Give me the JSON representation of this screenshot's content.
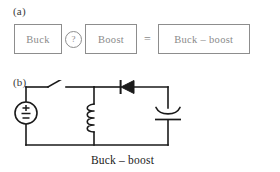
{
  "figure": {
    "panel_a": {
      "label": "(a)",
      "terms": [
        {
          "id": "buck",
          "text": "Buck"
        },
        {
          "id": "boost",
          "text": "Boost"
        },
        {
          "id": "result",
          "text": "Buck – boost"
        }
      ],
      "operator": {
        "icon": "question-circle-icon",
        "symbol": "?"
      },
      "equals_symbol": "=",
      "bracket_color": "#8d8d8d",
      "text_color": "#8a8a8a"
    },
    "panel_b": {
      "label": "(b)",
      "caption": "Buck – boost",
      "line_color": "#1a1a1a",
      "components": [
        {
          "id": "source",
          "icon": "voltage-source-icon",
          "symbol": "±"
        },
        {
          "id": "switch",
          "icon": "open-switch-icon"
        },
        {
          "id": "inductor",
          "icon": "inductor-coil-icon"
        },
        {
          "id": "diode",
          "icon": "diode-icon"
        },
        {
          "id": "capacitor",
          "icon": "polarized-capacitor-icon"
        }
      ]
    }
  }
}
